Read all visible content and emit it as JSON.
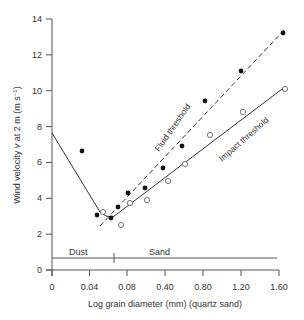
{
  "chart_data": {
    "type": "scatter",
    "title": "",
    "xlabel": "Log grain diameter (mm) (quartz sand)",
    "ylabel": "Wind velocity v at 2 m (m s⁻¹)",
    "x_ticks": [
      "0",
      "0.04",
      "0.08",
      "0.40",
      "0.80",
      "1.20",
      "1.60"
    ],
    "y_ticks": [
      "0",
      "2",
      "4",
      "6",
      "8",
      "10",
      "12",
      "14"
    ],
    "ylim": [
      0,
      14
    ],
    "grid": false,
    "annotations": [
      "Fluid threshold",
      "Impact threshold",
      "Dust",
      "Sand"
    ],
    "series": [
      {
        "name": "Fluid threshold (observed)",
        "marker": "filled-circle",
        "points_px": [
          [
            82,
            151
          ],
          [
            97,
            215
          ],
          [
            111,
            218
          ],
          [
            118,
            207
          ],
          [
            128,
            193
          ],
          [
            145,
            188
          ],
          [
            163,
            168
          ],
          [
            182,
            146
          ],
          [
            205,
            101
          ],
          [
            241,
            71
          ],
          [
            283,
            33
          ]
        ],
        "values": [
          5.1,
          3.0,
          2.8,
          3.5,
          4.3,
          4.6,
          5.7,
          7.0,
          9.4,
          11.0,
          13.2
        ]
      },
      {
        "name": "Impact threshold (observed)",
        "marker": "open-circle",
        "points_px": [
          [
            103,
            212
          ],
          [
            121,
            225
          ],
          [
            130,
            203
          ],
          [
            147,
            200
          ],
          [
            168,
            181
          ],
          [
            185,
            164
          ],
          [
            210,
            135
          ],
          [
            243,
            112
          ],
          [
            285,
            89
          ]
        ],
        "values": [
          3.3,
          2.7,
          3.8,
          3.9,
          5.1,
          5.8,
          7.5,
          8.8,
          10.1
        ]
      }
    ],
    "curves": [
      {
        "name": "Fluid threshold",
        "style": "dashed",
        "points_px": [
          [
            100,
            226
          ],
          [
            286,
            28
          ]
        ]
      },
      {
        "name": "Impact threshold",
        "style": "solid",
        "points_px": [
          [
            52,
            133
          ],
          [
            100,
            212
          ],
          [
            106,
            216
          ],
          [
            113,
            217
          ],
          [
            286,
            86
          ]
        ]
      }
    ]
  },
  "labels": {
    "fluid": "Fluid threshold",
    "impact": "Impact threshold",
    "dust": "Dust",
    "sand": "Sand",
    "xlabel": "Log grain diameter (mm) (quartz sand)",
    "ylabel_main": "Wind velocity ",
    "ylabel_var": "v",
    "ylabel_rest": " at 2 m (m s",
    "ylabel_sup": "−1",
    "ylabel_close": ")"
  },
  "colors": {
    "axis": "#555555",
    "line": "#333333",
    "marker": "#111111"
  }
}
